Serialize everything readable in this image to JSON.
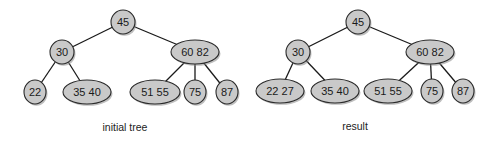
{
  "colors": {
    "node_fill": "#c9c9c9",
    "node_stroke": "#2a2a2a",
    "edge": "#1a1a1a",
    "background": "#ffffff"
  },
  "trees": [
    {
      "caption": "initial tree",
      "caption_pos": [
        125,
        131
      ],
      "nodes": [
        {
          "id": "root",
          "keys": [
            "45"
          ],
          "x": 123,
          "y": 22,
          "rx": 12,
          "ry": 12
        },
        {
          "id": "l",
          "keys": [
            "30"
          ],
          "x": 62,
          "y": 52,
          "rx": 12,
          "ry": 12
        },
        {
          "id": "r",
          "keys": [
            "60",
            "82"
          ],
          "x": 195,
          "y": 52,
          "rx": 24,
          "ry": 12
        },
        {
          "id": "ll",
          "keys": [
            "22"
          ],
          "x": 35,
          "y": 92,
          "rx": 11,
          "ry": 12
        },
        {
          "id": "lr",
          "keys": [
            "35",
            "40"
          ],
          "x": 87,
          "y": 92,
          "rx": 24,
          "ry": 12
        },
        {
          "id": "rl",
          "keys": [
            "51",
            "55"
          ],
          "x": 155,
          "y": 92,
          "rx": 25,
          "ry": 12
        },
        {
          "id": "rm",
          "keys": [
            "75"
          ],
          "x": 195,
          "y": 92,
          "rx": 11,
          "ry": 12
        },
        {
          "id": "rr",
          "keys": [
            "87"
          ],
          "x": 227,
          "y": 92,
          "rx": 11,
          "ry": 12
        }
      ],
      "edges": [
        [
          "root",
          "l"
        ],
        [
          "root",
          "r"
        ],
        [
          "l",
          "ll"
        ],
        [
          "l",
          "lr"
        ],
        [
          "r",
          "rl"
        ],
        [
          "r",
          "rm"
        ],
        [
          "r",
          "rr"
        ]
      ]
    },
    {
      "caption": "result",
      "caption_pos": [
        355,
        130
      ],
      "nodes": [
        {
          "id": "root",
          "keys": [
            "45"
          ],
          "x": 358,
          "y": 22,
          "rx": 12,
          "ry": 12
        },
        {
          "id": "l",
          "keys": [
            "30"
          ],
          "x": 298,
          "y": 52,
          "rx": 12,
          "ry": 12
        },
        {
          "id": "r",
          "keys": [
            "60",
            "82"
          ],
          "x": 430,
          "y": 52,
          "rx": 24,
          "ry": 12
        },
        {
          "id": "ll",
          "keys": [
            "22",
            "27"
          ],
          "x": 280,
          "y": 91,
          "rx": 24,
          "ry": 12
        },
        {
          "id": "lr",
          "keys": [
            "35",
            "40"
          ],
          "x": 335,
          "y": 91,
          "rx": 24,
          "ry": 12
        },
        {
          "id": "rl",
          "keys": [
            "51",
            "55"
          ],
          "x": 388,
          "y": 91,
          "rx": 24,
          "ry": 12
        },
        {
          "id": "rm",
          "keys": [
            "75"
          ],
          "x": 432,
          "y": 91,
          "rx": 11,
          "ry": 12
        },
        {
          "id": "rr",
          "keys": [
            "87"
          ],
          "x": 463,
          "y": 91,
          "rx": 11,
          "ry": 12
        }
      ],
      "edges": [
        [
          "root",
          "l"
        ],
        [
          "root",
          "r"
        ],
        [
          "l",
          "ll"
        ],
        [
          "l",
          "lr"
        ],
        [
          "r",
          "rl"
        ],
        [
          "r",
          "rm"
        ],
        [
          "r",
          "rr"
        ]
      ]
    }
  ]
}
